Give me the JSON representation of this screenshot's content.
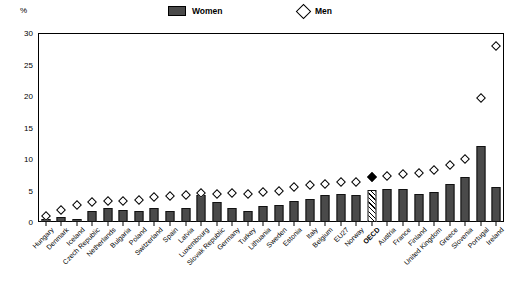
{
  "chart_data": {
    "type": "bar",
    "title": "",
    "subtitle": "",
    "xlabel": "",
    "ylabel": "%",
    "ylim": [
      0,
      30
    ],
    "yticks": [
      0,
      5,
      10,
      15,
      20,
      25,
      30
    ],
    "grid": false,
    "legend_position": "top-center",
    "legend": [
      {
        "name": "Women",
        "marker": "filled-bar",
        "color": "#4a4a4a"
      },
      {
        "name": "Men",
        "marker": "open-diamond",
        "color": "#ffffff"
      }
    ],
    "highlight_category": "OECD",
    "highlight_style": "hatched-bar-and-filled-diamond",
    "categories": [
      "Hungary",
      "Denmark",
      "Iceland",
      "Czech Republic",
      "Netherlands",
      "Bulgaria",
      "Poland",
      "Switzerland",
      "Spain",
      "Latvia",
      "Luxembourg",
      "Slovak Republic",
      "Germany",
      "Turkey",
      "Lithuania",
      "Sweden",
      "Estonia",
      "Italy",
      "Belgium",
      "EU27",
      "Norway",
      "OECD",
      "Austria",
      "France",
      "Finland",
      "United Kingdom",
      "Greece",
      "Slovenia",
      "Portugal",
      "Ireland"
    ],
    "series": [
      {
        "name": "Women",
        "marker": "bar",
        "values": [
          0.5,
          0.8,
          0.4,
          1.8,
          2.2,
          1.9,
          1.8,
          2.2,
          1.8,
          2.3,
          4.3,
          3.2,
          2.2,
          1.8,
          2.6,
          2.7,
          3.4,
          3.6,
          4.3,
          4.5,
          4.3,
          5.1,
          5.2,
          5.2,
          4.4,
          4.8,
          6.0,
          7.2,
          7.1,
          12.0
        ]
      },
      {
        "name": "Men",
        "marker": "diamond",
        "values": [
          1.0,
          1.9,
          2.7,
          3.2,
          3.3,
          3.4,
          3.5,
          3.9,
          4.2,
          4.3,
          4.6,
          4.4,
          4.6,
          4.5,
          4.7,
          4.9,
          5.6,
          5.8,
          6.1,
          6.3,
          6.3,
          7.2,
          7.3,
          7.6,
          7.8,
          8.2,
          9.1,
          10.0,
          12.5,
          19.7
        ]
      }
    ],
    "note_last_bar_value": 5.6,
    "note_last_bar_category": "Ireland",
    "note_last_diamond_value": 28.0
  }
}
